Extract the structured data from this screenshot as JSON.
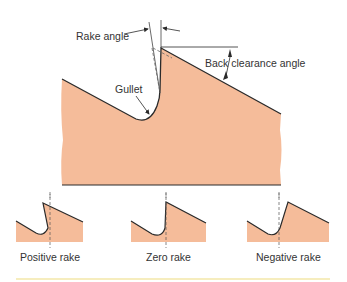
{
  "colors": {
    "fill": "#f5bc9a",
    "outline": "#2a2a2a",
    "accent_line": "#f3e7a8"
  },
  "labels": {
    "rake_angle": "Rake angle",
    "back_clearance_angle": "Back clearance angle",
    "gullet": "Gullet"
  },
  "variants": [
    {
      "label": "Positive rake"
    },
    {
      "label": "Zero rake"
    },
    {
      "label": "Negative rake"
    }
  ]
}
